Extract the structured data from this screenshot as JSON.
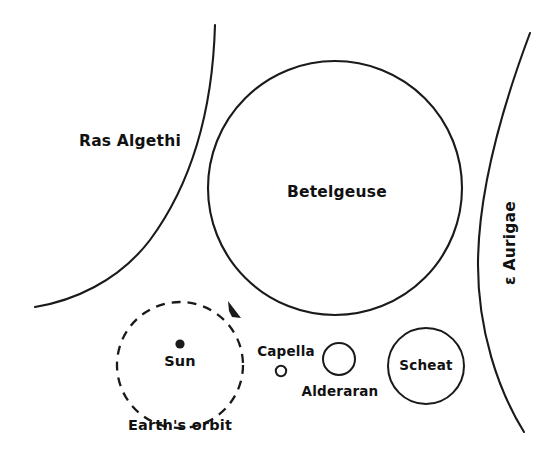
{
  "diagram": {
    "type": "stellar-size-comparison",
    "width": 556,
    "height": 453,
    "background_color": "#ffffff",
    "ink_color": "#1a1a1a"
  },
  "labels": {
    "ras_algethi": "Ras Algethi",
    "betelgeuse": "Betelgeuse",
    "epsilon_aurigae": "ε Aurigae",
    "sun": "Sun",
    "earths_orbit": "Earth's orbit",
    "capella": "Capella",
    "alderaran": "Alderaran",
    "scheat": "Scheat"
  },
  "objects": [
    {
      "name": "ras-algethi",
      "label": "Ras Algethi",
      "shape": "arc",
      "note": "partial stellar limb, too large to fit in frame",
      "label_x": 130,
      "label_y": 141
    },
    {
      "name": "betelgeuse",
      "label": "Betelgeuse",
      "shape": "circle",
      "cx": 335,
      "cy": 188,
      "r": 127,
      "stroke_width": 2.1,
      "label_x": 337,
      "label_y": 192
    },
    {
      "name": "epsilon-aurigae",
      "label": "ε Aurigae",
      "shape": "arc",
      "note": "partial stellar limb, too large to fit in frame",
      "label_x": 510,
      "label_y": 243,
      "label_rotation": -90
    },
    {
      "name": "earths-orbit",
      "label": "Earth's orbit",
      "shape": "dashed-circle",
      "cx": 180,
      "cy": 365,
      "r": 63,
      "stroke_width": 2.3,
      "label_x": 180,
      "label_y": 426
    },
    {
      "name": "sun",
      "label": "Sun",
      "shape": "filled-dot",
      "cx": 180,
      "cy": 344,
      "r": 4.6,
      "label_x": 180,
      "label_y": 362
    },
    {
      "name": "capella",
      "label": "Capella",
      "shape": "circle",
      "cx": 281,
      "cy": 371,
      "r": 5.2,
      "stroke_width": 2.0,
      "label_x": 286,
      "label_y": 352
    },
    {
      "name": "alderaran",
      "label": "Alderaran",
      "shape": "circle",
      "cx": 339,
      "cy": 359,
      "r": 16,
      "stroke_width": 2.0,
      "label_x": 340,
      "label_y": 392
    },
    {
      "name": "scheat",
      "label": "Scheat",
      "shape": "circle",
      "cx": 426,
      "cy": 366,
      "r": 38,
      "stroke_width": 2.0,
      "label_x": 426,
      "label_y": 366
    }
  ],
  "orbit_direction_arrow": {
    "name": "orbit-direction-arrow",
    "x": 236,
    "y": 313,
    "direction": "clockwise"
  }
}
